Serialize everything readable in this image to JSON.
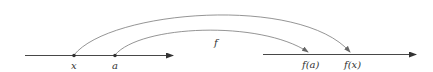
{
  "diagram": {
    "domain_line": {
      "points": [
        {
          "label": "x",
          "pos": 74
        },
        {
          "label": "a",
          "pos": 115
        }
      ]
    },
    "codomain_line": {
      "points": [
        {
          "label": "f(a)",
          "pos": 310
        },
        {
          "label": "f(x)",
          "pos": 352
        }
      ]
    },
    "function_label": "f",
    "colors": {
      "line": "#333333",
      "arc": "#7a7a7a",
      "text": "#333333"
    }
  }
}
